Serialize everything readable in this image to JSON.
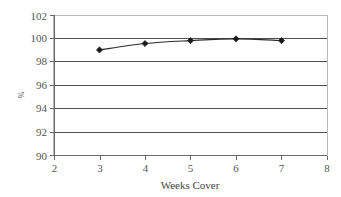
{
  "chart_data": {
    "type": "line",
    "title": "",
    "subtitle": "",
    "xlabel": "Weeks Cover",
    "ylabel": "%",
    "xlim": [
      2,
      8
    ],
    "ylim": [
      90,
      102
    ],
    "xticks": [
      2,
      3,
      4,
      5,
      6,
      7,
      8
    ],
    "yticks": [
      90,
      92,
      94,
      96,
      98,
      100,
      102
    ],
    "xtick_labels": [
      "2",
      "3",
      "4",
      "5",
      "6",
      "7",
      "8"
    ],
    "ytick_labels": [
      "90",
      "92",
      "94",
      "96",
      "98",
      "100",
      "102"
    ],
    "grid": "horizontal",
    "legend": "none",
    "marker": "diamond",
    "line_color": "#2b2b2b",
    "marker_color": "#1a1a1a",
    "grid_color": "#3d3d3d",
    "border_color": "#b8b8b8",
    "x": [
      3,
      4,
      5,
      6,
      7
    ],
    "values": [
      99.05,
      99.6,
      99.85,
      100.0,
      99.85
    ],
    "series": [
      {
        "name": "Service level",
        "x": [
          3,
          4,
          5,
          6,
          7
        ],
        "values": [
          99.05,
          99.6,
          99.85,
          100.0,
          99.85
        ]
      }
    ],
    "annotations": []
  }
}
